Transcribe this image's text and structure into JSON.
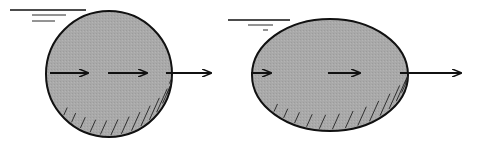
{
  "diagram": {
    "description": "Two shaded bodies (circle and ellipse) below a water surface, each with horizontal flow arrows passing through and exiting on the right",
    "colors": {
      "fill": "#a9a9a9",
      "stroke": "#111111",
      "background": "#ffffff"
    },
    "figures": [
      {
        "name": "circle-body",
        "shape": "circle",
        "cx": 109,
        "cy": 74,
        "r": 63,
        "water_lines": [
          {
            "x1": 10,
            "x2": 86,
            "y": 10
          },
          {
            "x1": 32,
            "x2": 66,
            "y": 15
          },
          {
            "x1": 32,
            "x2": 55,
            "y": 21
          }
        ],
        "arrows": [
          {
            "x1": 50,
            "x2": 88,
            "y": 73
          },
          {
            "x1": 108,
            "x2": 147,
            "y": 73
          },
          {
            "x1": 166,
            "x2": 211,
            "y": 73
          }
        ]
      },
      {
        "name": "ellipse-body",
        "shape": "ellipse",
        "cx": 330,
        "cy": 75,
        "rx": 78,
        "ry": 56,
        "water_lines": [
          {
            "x1": 228,
            "x2": 290,
            "y": 20
          },
          {
            "x1": 248,
            "x2": 273,
            "y": 25
          },
          {
            "x1": 263,
            "x2": 268,
            "y": 30
          }
        ],
        "arrows": [
          {
            "x1": 251,
            "x2": 271,
            "y": 73
          },
          {
            "x1": 328,
            "x2": 360,
            "y": 73
          },
          {
            "x1": 400,
            "x2": 461,
            "y": 73
          }
        ]
      }
    ]
  }
}
